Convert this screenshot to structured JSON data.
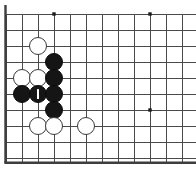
{
  "board": {
    "title": "Go board diagram",
    "kind": "go-board-position",
    "display_columns": 12,
    "display_rows": 10,
    "cell_px": 16,
    "origin_x_px": 6,
    "origin_y_px": 14,
    "edge_color": "#3d3d3d",
    "grid_color": "#4a4a4a",
    "background_color": "#ffffff",
    "black_color": "#151515",
    "white_color": "#ffffff",
    "white_outline_color": "#3a3a3a",
    "edges": {
      "left": true,
      "bottom": true,
      "top": false,
      "right": false
    },
    "star_points": [
      {
        "name": "star-point-top-left",
        "x": 54,
        "y": 14
      },
      {
        "name": "star-point-top-right",
        "x": 150,
        "y": 14
      },
      {
        "name": "star-point-right",
        "x": 150,
        "y": 110
      }
    ],
    "stones": [
      {
        "name": "white-stone-1",
        "color": "white",
        "x": 38,
        "y": 46,
        "r": 9
      },
      {
        "name": "black-stone-1",
        "color": "black",
        "x": 54,
        "y": 62,
        "r": 9
      },
      {
        "name": "white-stone-2",
        "color": "white",
        "x": 22,
        "y": 78,
        "r": 9
      },
      {
        "name": "white-stone-3",
        "color": "white",
        "x": 38,
        "y": 78,
        "r": 9
      },
      {
        "name": "black-stone-2",
        "color": "black",
        "x": 54,
        "y": 78,
        "r": 9
      },
      {
        "name": "black-stone-3",
        "color": "black",
        "x": 22,
        "y": 94,
        "r": 9
      },
      {
        "name": "black-stone-marked-1",
        "color": "black",
        "x": 38,
        "y": 94,
        "r": 9,
        "marker": "1"
      },
      {
        "name": "black-stone-4",
        "color": "black",
        "x": 54,
        "y": 94,
        "r": 9
      },
      {
        "name": "black-stone-5",
        "color": "black",
        "x": 54,
        "y": 110,
        "r": 9
      },
      {
        "name": "white-stone-4",
        "color": "white",
        "x": 38,
        "y": 126,
        "r": 9
      },
      {
        "name": "white-stone-5",
        "color": "white",
        "x": 54,
        "y": 126,
        "r": 9
      },
      {
        "name": "white-stone-6",
        "color": "white",
        "x": 86,
        "y": 126,
        "r": 9
      }
    ],
    "move_labels": [
      {
        "name": "move-label-1",
        "text": "1",
        "x": 38,
        "y": 94
      }
    ]
  }
}
